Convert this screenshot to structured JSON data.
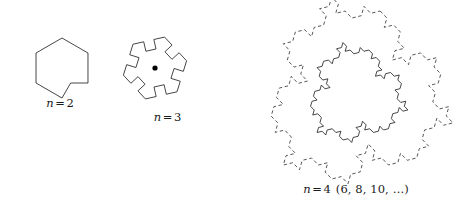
{
  "figure": {
    "background_color": "#ffffff",
    "stroke_color": "#262626",
    "dash_stroke_color": "#3a3a3a",
    "dot_color": "#000000",
    "panels": [
      {
        "id": "n2",
        "label_var": "n",
        "label_op": "=",
        "label_value": "2",
        "label_suffix": "",
        "label_full": "n = 2",
        "shape": "hexagon-with-notch",
        "iteration_order": 0,
        "sides": 6,
        "has_center_dot": false,
        "dashed_outer": false,
        "center": {
          "x": 62,
          "y": 68
        },
        "radius": 30
      },
      {
        "id": "n3",
        "label_var": "n",
        "label_op": "=",
        "label_value": "3",
        "label_suffix": "",
        "label_full": "n = 3",
        "shape": "pinwheel-fractal",
        "iteration_order": 1,
        "sides": 6,
        "has_center_dot": true,
        "dashed_outer": false,
        "center": {
          "x": 50,
          "y": 68
        },
        "radius": 45,
        "dot_radius": 2.6
      },
      {
        "id": "n4",
        "label_var": "n",
        "label_op": "=",
        "label_value": "4",
        "label_suffix": "(6, 8, 10, …)",
        "label_full": "n = 4 (6, 8, 10, …)",
        "shape": "gosper-island-fractal",
        "iteration_order": 2,
        "sides": 6,
        "has_center_dot": false,
        "dashed_outer": true,
        "center": {
          "x": 116,
          "y": 95
        },
        "radius": 60,
        "dashed_radius": 95
      }
    ],
    "notes": {
      "sequence_label": "n = 4 (6, 8, 10, …)",
      "ellipsis": "…"
    }
  }
}
